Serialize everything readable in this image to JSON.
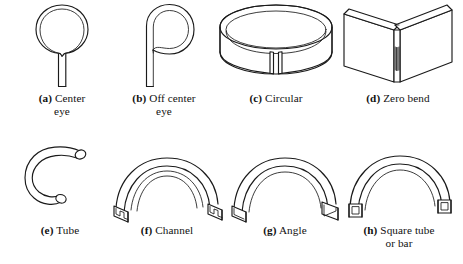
{
  "figure": {
    "background_color": "#ffffff",
    "line_color": "#1a1a1a",
    "rows": 2,
    "columns": 4,
    "total_items": 8
  },
  "items": [
    {
      "key": "a",
      "label": "(a)",
      "caption_line1": "Center",
      "caption_line2": "eye",
      "full_caption": "(a) Center eye",
      "icon": "center-eye-loop-diagram"
    },
    {
      "key": "b",
      "label": "(b)",
      "caption_line1": "Off center",
      "caption_line2": "eye",
      "full_caption": "(b) Off center eye",
      "icon": "off-center-eye-loop-diagram"
    },
    {
      "key": "c",
      "label": "(c)",
      "caption_line1": "Circular",
      "caption_line2": "",
      "full_caption": "(c) Circular",
      "icon": "circular-band-diagram"
    },
    {
      "key": "d",
      "label": "(d)",
      "caption_line1": "Zero bend",
      "caption_line2": "",
      "full_caption": "(d) Zero bend",
      "icon": "zero-bend-plate-diagram"
    },
    {
      "key": "e",
      "label": "(e)",
      "caption_line1": "Tube",
      "caption_line2": "",
      "full_caption": "(e) Tube",
      "icon": "bent-round-tube-diagram"
    },
    {
      "key": "f",
      "label": "(f)",
      "caption_line1": "Channel",
      "caption_line2": "",
      "full_caption": "(f) Channel",
      "icon": "bent-channel-section-diagram"
    },
    {
      "key": "g",
      "label": "(g)",
      "caption_line1": "Angle",
      "caption_line2": "",
      "full_caption": "(g) Angle",
      "icon": "bent-angle-section-diagram"
    },
    {
      "key": "h",
      "label": "(h)",
      "caption_line1": "Square tube",
      "caption_line2": "or bar",
      "full_caption": "(h) Square tube or bar",
      "icon": "bent-square-tube-diagram"
    }
  ]
}
